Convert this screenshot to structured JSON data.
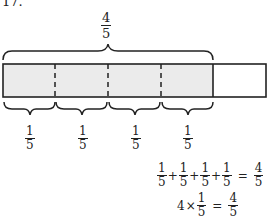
{
  "problem_number": "17.",
  "top_label": {
    "numerator": "4",
    "denominator": "5"
  },
  "bar": {
    "total_parts": 5,
    "shaded_parts": 4,
    "shade_color": "#ebebeb",
    "outline_color": "#222222"
  },
  "part_labels": [
    {
      "numerator": "1",
      "denominator": "5"
    },
    {
      "numerator": "1",
      "denominator": "5"
    },
    {
      "numerator": "1",
      "denominator": "5"
    },
    {
      "numerator": "1",
      "denominator": "5"
    }
  ],
  "equation_sum": {
    "terms": [
      {
        "numerator": "1",
        "denominator": "5"
      },
      {
        "numerator": "1",
        "denominator": "5"
      },
      {
        "numerator": "1",
        "denominator": "5"
      },
      {
        "numerator": "1",
        "denominator": "5"
      }
    ],
    "operator": "+",
    "equals": "=",
    "result": {
      "numerator": "4",
      "denominator": "5"
    }
  },
  "equation_product": {
    "multiplier": "4",
    "operator": "×",
    "term": {
      "numerator": "1",
      "denominator": "5"
    },
    "equals": "=",
    "result": {
      "numerator": "4",
      "denominator": "5"
    }
  }
}
